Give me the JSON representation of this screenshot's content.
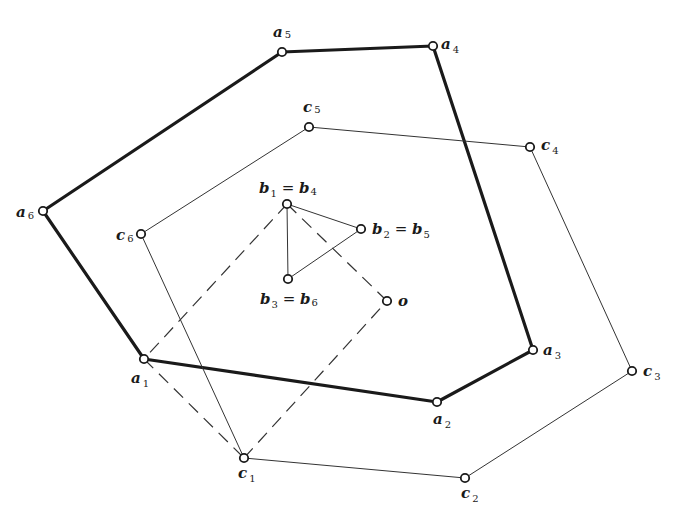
{
  "diagram": {
    "polygons": {
      "a": {
        "style": "thick",
        "color": "#1a1a1a",
        "vertices": [
          {
            "id": "a1",
            "label": "a",
            "sub": "1",
            "x": 144,
            "y": 359
          },
          {
            "id": "a2",
            "label": "a",
            "sub": "2",
            "x": 437,
            "y": 402
          },
          {
            "id": "a3",
            "label": "a",
            "sub": "3",
            "x": 533,
            "y": 350
          },
          {
            "id": "a4",
            "label": "a",
            "sub": "4",
            "x": 433,
            "y": 46
          },
          {
            "id": "a5",
            "label": "a",
            "sub": "5",
            "x": 282,
            "y": 52
          },
          {
            "id": "a6",
            "label": "a",
            "sub": "6",
            "x": 43,
            "y": 211
          }
        ]
      },
      "c": {
        "style": "thin",
        "color": "#333333",
        "vertices": [
          {
            "id": "c1",
            "label": "c",
            "sub": "1",
            "x": 244,
            "y": 458
          },
          {
            "id": "c2",
            "label": "c",
            "sub": "2",
            "x": 465,
            "y": 478
          },
          {
            "id": "c3",
            "label": "c",
            "sub": "3",
            "x": 632,
            "y": 371
          },
          {
            "id": "c4",
            "label": "c",
            "sub": "4",
            "x": 530,
            "y": 147
          },
          {
            "id": "c5",
            "label": "c",
            "sub": "5",
            "x": 309,
            "y": 127
          },
          {
            "id": "c6",
            "label": "c",
            "sub": "6",
            "x": 141,
            "y": 234
          }
        ]
      },
      "b": {
        "style": "thin",
        "color": "#333333",
        "vertices": [
          {
            "id": "b1",
            "label": "b₁ = b₄",
            "x": 287,
            "y": 204
          },
          {
            "id": "b2",
            "label": "b₂ = b₅",
            "x": 361,
            "y": 229
          },
          {
            "id": "b3",
            "label": "b₃ = b₆",
            "x": 288,
            "y": 279
          }
        ]
      }
    },
    "extra_edges": [
      {
        "from": "c6",
        "to": "c1",
        "style": "thin"
      }
    ],
    "origin": {
      "id": "o",
      "label": "o",
      "x": 387,
      "y": 301
    },
    "dashed_edges": [
      {
        "from": "b1",
        "to": "a1"
      },
      {
        "from": "b1",
        "to": "o"
      },
      {
        "from": "a1",
        "to": "c1"
      },
      {
        "from": "c1",
        "to": "o"
      }
    ],
    "labels": {
      "a1": {
        "main": "a",
        "sub": "1"
      },
      "a2": {
        "main": "a",
        "sub": "2"
      },
      "a3": {
        "main": "a",
        "sub": "3"
      },
      "a4": {
        "main": "a",
        "sub": "4"
      },
      "a5": {
        "main": "a",
        "sub": "5"
      },
      "a6": {
        "main": "a",
        "sub": "6"
      },
      "c1": {
        "main": "c",
        "sub": "1"
      },
      "c2": {
        "main": "c",
        "sub": "2"
      },
      "c3": {
        "main": "c",
        "sub": "3"
      },
      "c4": {
        "main": "c",
        "sub": "4"
      },
      "c5": {
        "main": "c",
        "sub": "5"
      },
      "c6": {
        "main": "c",
        "sub": "6"
      },
      "b1": {
        "main": "b",
        "sub": "1",
        "eq": " = ",
        "main2": "b",
        "sub2": "4"
      },
      "b2": {
        "main": "b",
        "sub": "2",
        "eq": " = ",
        "main2": "b",
        "sub2": "5"
      },
      "b3": {
        "main": "b",
        "sub": "3",
        "eq": " = ",
        "main2": "b",
        "sub2": "6"
      },
      "o": {
        "main": "o"
      }
    }
  }
}
